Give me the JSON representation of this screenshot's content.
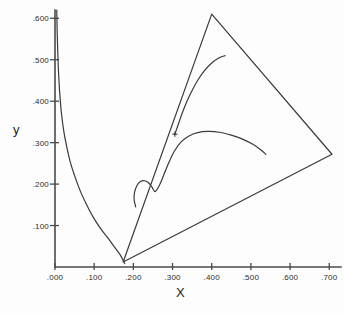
{
  "chart_data": {
    "type": "line",
    "title": "",
    "subtitle": "",
    "xlabel": "X",
    "ylabel": "y",
    "xlim": [
      0.0,
      0.73
    ],
    "ylim": [
      0.0,
      0.62
    ],
    "grid": false,
    "legend": null,
    "x_ticks": [
      {
        "value": 0.0,
        "label": ".000"
      },
      {
        "value": 0.1,
        "label": ".100"
      },
      {
        "value": 0.2,
        "label": ".200"
      },
      {
        "value": 0.3,
        "label": ".300"
      },
      {
        "value": 0.4,
        "label": ".400"
      },
      {
        "value": 0.5,
        "label": ".500"
      },
      {
        "value": 0.6,
        "label": ".600"
      },
      {
        "value": 0.7,
        "label": ".700"
      }
    ],
    "y_ticks": [
      {
        "value": 0.1,
        "label": ".100"
      },
      {
        "value": 0.2,
        "label": ".200"
      },
      {
        "value": 0.3,
        "label": ".300"
      },
      {
        "value": 0.4,
        "label": ".400"
      },
      {
        "value": 0.5,
        "label": ".500"
      },
      {
        "value": 0.6,
        "label": ".600"
      }
    ],
    "series": [
      {
        "name": "spectral-locus",
        "kind": "curve",
        "points": [
          [
            0.0045,
            0.62
          ],
          [
            0.0055,
            0.57
          ],
          [
            0.007,
            0.52
          ],
          [
            0.009,
            0.47
          ],
          [
            0.012,
            0.42
          ],
          [
            0.016,
            0.375
          ],
          [
            0.022,
            0.33
          ],
          [
            0.03,
            0.29
          ],
          [
            0.04,
            0.25
          ],
          [
            0.052,
            0.215
          ],
          [
            0.066,
            0.18
          ],
          [
            0.082,
            0.148
          ],
          [
            0.099,
            0.118
          ],
          [
            0.117,
            0.092
          ],
          [
            0.135,
            0.07
          ],
          [
            0.152,
            0.048
          ],
          [
            0.166,
            0.03
          ],
          [
            0.174,
            0.016
          ],
          [
            0.178,
            0.008
          ]
        ]
      },
      {
        "name": "planckian-upper-arc",
        "kind": "curve",
        "points": [
          [
            0.206,
            0.145
          ],
          [
            0.202,
            0.162
          ],
          [
            0.203,
            0.18
          ],
          [
            0.209,
            0.196
          ],
          [
            0.218,
            0.206
          ],
          [
            0.229,
            0.208
          ],
          [
            0.24,
            0.202
          ],
          [
            0.248,
            0.192
          ],
          [
            0.256,
            0.182
          ],
          [
            0.268,
            0.2
          ],
          [
            0.28,
            0.228
          ],
          [
            0.292,
            0.255
          ],
          [
            0.305,
            0.28
          ],
          [
            0.322,
            0.302
          ],
          [
            0.342,
            0.316
          ],
          [
            0.364,
            0.324
          ],
          [
            0.39,
            0.327
          ],
          [
            0.42,
            0.325
          ],
          [
            0.45,
            0.318
          ],
          [
            0.48,
            0.308
          ],
          [
            0.505,
            0.296
          ],
          [
            0.525,
            0.283
          ],
          [
            0.538,
            0.272
          ]
        ]
      },
      {
        "name": "upper-branch",
        "kind": "curve",
        "points": [
          [
            0.306,
            0.32
          ],
          [
            0.315,
            0.345
          ],
          [
            0.325,
            0.372
          ],
          [
            0.336,
            0.398
          ],
          [
            0.349,
            0.424
          ],
          [
            0.364,
            0.45
          ],
          [
            0.381,
            0.473
          ],
          [
            0.4,
            0.492
          ],
          [
            0.418,
            0.504
          ],
          [
            0.434,
            0.51
          ]
        ]
      },
      {
        "name": "gamut-triangle",
        "kind": "polyline",
        "points": [
          [
            0.4,
            0.61
          ],
          [
            0.707,
            0.272
          ],
          [
            0.174,
            0.012
          ],
          [
            0.4,
            0.61
          ]
        ]
      }
    ],
    "markers": [
      {
        "name": "white-point",
        "x": 0.306,
        "y": 0.3205,
        "glyph": "+"
      }
    ]
  },
  "axes": {
    "x_axis_name": "x-axis",
    "y_axis_name": "y-axis"
  },
  "colors": {
    "ink": "#3a3a3a",
    "axis": "#4a4a4a",
    "text": "#2b2b2b",
    "background": "#fdfdfd"
  }
}
